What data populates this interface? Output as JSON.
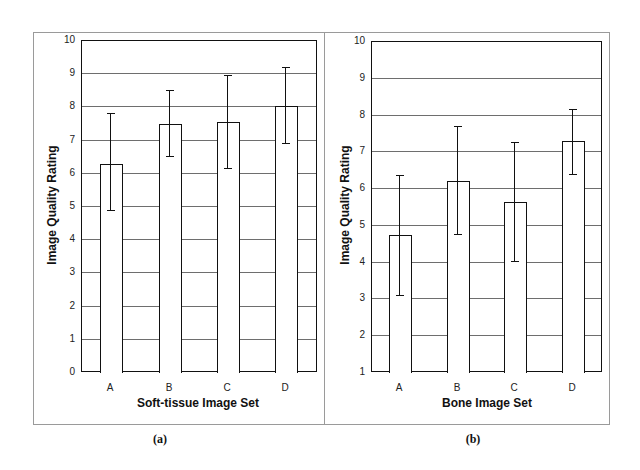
{
  "chart_data": [
    {
      "type": "bar",
      "panel": "(a)",
      "title": "",
      "xlabel": "Soft-tissue Image Set",
      "ylabel": "Image Quality Rating",
      "categories": [
        "A",
        "B",
        "C",
        "D"
      ],
      "values": [
        6.3,
        7.5,
        7.55,
        8.05
      ],
      "error_high": [
        7.8,
        8.5,
        8.95,
        9.2
      ],
      "error_low": [
        4.9,
        6.5,
        6.15,
        6.9
      ],
      "ylim": [
        0,
        10
      ],
      "yticks": [
        "0",
        "1",
        "2",
        "3",
        "4",
        "5",
        "6",
        "7",
        "8",
        "9",
        "10"
      ],
      "grid": true,
      "legend": null
    },
    {
      "type": "bar",
      "panel": "(b)",
      "title": "",
      "xlabel": "Bone Image Set",
      "ylabel": "Image Quality Rating",
      "categories": [
        "A",
        "B",
        "C",
        "D"
      ],
      "values": [
        4.75,
        6.22,
        5.65,
        7.3
      ],
      "error_high": [
        6.35,
        7.7,
        7.27,
        8.15
      ],
      "error_low": [
        3.1,
        4.75,
        4.02,
        6.4
      ],
      "ylim": [
        1,
        10
      ],
      "yticks": [
        "1",
        "2",
        "3",
        "4",
        "5",
        "6",
        "7",
        "8",
        "9",
        "10"
      ],
      "grid": true,
      "legend": null
    }
  ],
  "panels": {
    "a": {
      "caption": "(a)",
      "xlabel": "Soft-tissue Image Set",
      "ylabel": "Image Quality Rating"
    },
    "b": {
      "caption": "(b)",
      "xlabel": "Bone Image Set",
      "ylabel": "Image Quality Rating"
    }
  },
  "colors": {
    "bar_fill": "#ffffff",
    "bar_edge": "#111111",
    "grid": "#6e6e6e",
    "frame": "#9a9a9a"
  }
}
